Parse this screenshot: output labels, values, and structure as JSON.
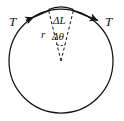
{
  "figure": {
    "type": "physics-diagram",
    "background_color": "#ffffff",
    "stroke_color": "#141414",
    "labels": {
      "tension_left": "T",
      "tension_right": "T",
      "arc_length": "ΔL",
      "radius": "r",
      "angle": "Δθ"
    },
    "geometry": {
      "circle": {
        "cx": 61,
        "cy": 61,
        "r": 52
      },
      "wedge_apex": {
        "x": 61,
        "y": 61
      },
      "arc_midpoint_top": {
        "x": 61,
        "y": 9
      },
      "half_angle_degrees": 14
    },
    "elements": [
      {
        "name": "circle-outline",
        "kind": "circle"
      },
      {
        "name": "arc-segment",
        "kind": "arc"
      },
      {
        "name": "radius-line-left",
        "kind": "dashed-line"
      },
      {
        "name": "radius-line-right",
        "kind": "dashed-line"
      },
      {
        "name": "angle-arc",
        "kind": "arc"
      },
      {
        "name": "tension-arrow-left",
        "kind": "arrow"
      },
      {
        "name": "tension-arrow-right",
        "kind": "arrow"
      }
    ]
  }
}
